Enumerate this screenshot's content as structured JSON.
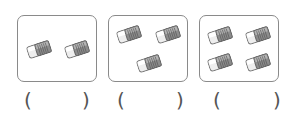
{
  "worksheet": {
    "item_icon": "eraser-icon",
    "groups": [
      {
        "count": 2,
        "answer": "",
        "open": "(",
        "close": ")"
      },
      {
        "count": 3,
        "answer": "",
        "open": "(",
        "close": ")"
      },
      {
        "count": 4,
        "answer": "",
        "open": "(",
        "close": ")"
      }
    ]
  }
}
